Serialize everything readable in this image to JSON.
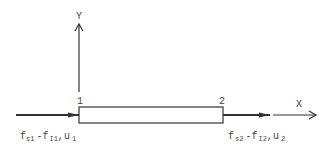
{
  "diagram": {
    "type": "bar-element-free-body",
    "axes": {
      "y_label": "Y",
      "x_label": "X"
    },
    "nodes": [
      {
        "id": "1",
        "label": "1"
      },
      {
        "id": "2",
        "label": "2"
      }
    ],
    "element": {
      "shape": "rectangle",
      "from_node": "1",
      "to_node": "2"
    },
    "forces": [
      {
        "node": "1",
        "direction": "right",
        "label": {
          "f": "f",
          "sub1": "s1",
          "minus": "-",
          "f2": "f",
          "sub2": "I1",
          "comma": ",",
          "u": "u",
          "sub3": "1"
        }
      },
      {
        "node": "2",
        "direction": "right",
        "label": {
          "f": "f",
          "sub1": "s2",
          "minus": "-",
          "f2": "f",
          "sub2": "I2",
          "comma": ",",
          "u": "u",
          "sub3": "2"
        }
      }
    ],
    "colors": {
      "line": "#333333",
      "text": "#444444",
      "background": "#ffffff"
    }
  }
}
